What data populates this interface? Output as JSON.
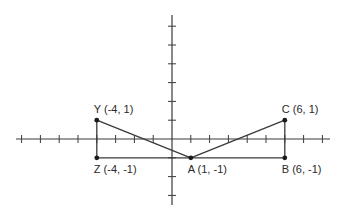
{
  "diagram": {
    "type": "coordinate-plane",
    "axes": {
      "origin_px": [
        172,
        139
      ],
      "unit_px": 18.8,
      "x_ticks": [
        -8,
        -7,
        -6,
        -5,
        -4,
        -3,
        -2,
        -1,
        1,
        2,
        3,
        4,
        5,
        6,
        7,
        8
      ],
      "y_ticks": [
        -3,
        -2,
        -1,
        1,
        2,
        3,
        4,
        5,
        6
      ],
      "x_range_px": [
        16,
        330
      ],
      "y_range_px": [
        15,
        205
      ]
    },
    "points": [
      {
        "id": "Y",
        "x": -4,
        "y": 1,
        "label": "Y (-4, 1)",
        "label_pos": "above"
      },
      {
        "id": "Z",
        "x": -4,
        "y": -1,
        "label": "Z (-4, -1)",
        "label_pos": "below"
      },
      {
        "id": "A",
        "x": 1,
        "y": -1,
        "label": "A (1, -1)",
        "label_pos": "below"
      },
      {
        "id": "B",
        "x": 6,
        "y": -1,
        "label": "B (6, -1)",
        "label_pos": "below"
      },
      {
        "id": "C",
        "x": 6,
        "y": 1,
        "label": "C (6, 1)",
        "label_pos": "above"
      }
    ],
    "segments": [
      [
        "Y",
        "Z"
      ],
      [
        "Z",
        "B"
      ],
      [
        "Y",
        "A"
      ],
      [
        "A",
        "C"
      ],
      [
        "C",
        "B"
      ]
    ],
    "triangles": [
      {
        "name": "triangle-YZA",
        "vertices": [
          "Y",
          "Z",
          "A"
        ]
      },
      {
        "name": "triangle-ABC",
        "vertices": [
          "A",
          "B",
          "C"
        ]
      }
    ],
    "colors": {
      "line": "#3a3a3a",
      "point": "#1a1a1a",
      "text": "#2a2a2a",
      "background": "#ffffff"
    }
  }
}
